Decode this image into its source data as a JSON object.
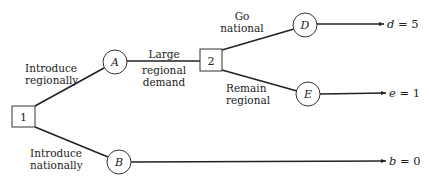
{
  "diagram": {
    "type": "decision-tree",
    "decision_nodes": [
      {
        "id": "1",
        "label": "1"
      },
      {
        "id": "2",
        "label": "2"
      }
    ],
    "chance_nodes": [
      {
        "id": "A",
        "label": "A"
      },
      {
        "id": "B",
        "label": "B"
      },
      {
        "id": "D",
        "label": "D"
      },
      {
        "id": "E",
        "label": "E"
      }
    ],
    "branches": {
      "introduce_regionally": {
        "line1": "Introduce",
        "line2": "regionally"
      },
      "introduce_nationally": {
        "line1": "Introduce",
        "line2": "nationally"
      },
      "large_regional_demand": {
        "line1": "Large",
        "line2": "regional",
        "line3": "demand"
      },
      "go_national": {
        "line1": "Go",
        "line2": "national"
      },
      "remain_regional": {
        "line1": "Remain",
        "line2": "regional"
      }
    },
    "outcomes": {
      "d": {
        "var": "d",
        "eq": " = 5"
      },
      "e": {
        "var": "e",
        "eq": " = 1"
      },
      "b": {
        "var": "b",
        "eq": " = 0"
      }
    }
  }
}
